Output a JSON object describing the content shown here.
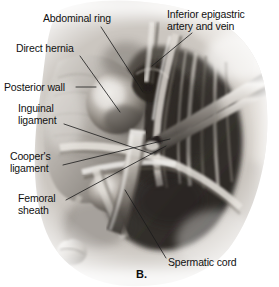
{
  "figure": {
    "letter": "B.",
    "caption_labels": [
      {
        "id": "abdominal-ring",
        "text": "Abdominal ring",
        "x": 43,
        "y": 12,
        "align": "left"
      },
      {
        "id": "inferior-epigastric-artery-and-vein",
        "text": "Inferior epigastric\nartery and vein",
        "x": 194,
        "y": 8,
        "align": "left"
      },
      {
        "id": "direct-hernia",
        "text": "Direct hernia",
        "x": 16,
        "y": 42,
        "align": "left"
      },
      {
        "id": "posterior-wall",
        "text": "Posterior wall",
        "x": 6,
        "y": 82,
        "align": "left"
      },
      {
        "id": "inguinal-ligament",
        "text": "Inguinal\nligament",
        "x": 18,
        "y": 103,
        "align": "left"
      },
      {
        "id": "coopers-ligament",
        "text": "Cooper's\nligament",
        "x": 10,
        "y": 150,
        "align": "left"
      },
      {
        "id": "femoral-sheath",
        "text": "Femoral\nsheath",
        "x": 18,
        "y": 192,
        "align": "left"
      },
      {
        "id": "spermatic-cord",
        "text": "Spermatic cord",
        "x": 168,
        "y": 256,
        "align": "left"
      }
    ],
    "leaders": [
      {
        "id": "leader-abdominal-ring",
        "x1": 101,
        "y1": 27,
        "x2": 143,
        "y2": 92
      },
      {
        "id": "leader-inferior-epigastric",
        "x1": 192,
        "y1": 33,
        "x2": 152,
        "y2": 66
      },
      {
        "id": "leader-direct-hernia",
        "x1": 80,
        "y1": 56,
        "x2": 120,
        "y2": 112
      },
      {
        "id": "leader-posterior-wall",
        "x1": 76,
        "y1": 87,
        "x2": 96,
        "y2": 87
      },
      {
        "id": "leader-inguinal-ligament",
        "x1": 64,
        "y1": 124,
        "x2": 152,
        "y2": 154
      },
      {
        "id": "leader-coopers-ligament",
        "x1": 63,
        "y1": 165,
        "x2": 170,
        "y2": 139
      },
      {
        "id": "leader-femoral-sheath",
        "x1": 66,
        "y1": 200,
        "x2": 166,
        "y2": 146
      },
      {
        "id": "leader-spermatic-cord",
        "x1": 166,
        "y1": 258,
        "x2": 125,
        "y2": 190
      }
    ]
  },
  "colors": {
    "text": "#111111",
    "leader_line": "#1a1a1a",
    "background": "#ffffff",
    "tissue_light": "#e8e6e3",
    "tissue_mid": "#a8a39d",
    "tissue_dark": "#4a4640",
    "tissue_deep": "#2a2724",
    "instrument": "#d8d5d0"
  },
  "illustration": {
    "description": "Grayscale surgical illustration of the right inguinal region seen from within, showing a direct hernia bulge, the posterior inguinal wall, inguinal and Cooper's ligaments, femoral sheath, spermatic cord, and inferior epigastric vessels, retracted by instruments.",
    "structures": [
      "abdominal-ring",
      "direct-hernia-bulge",
      "posterior-wall",
      "inguinal-ligament",
      "coopers-ligament",
      "femoral-sheath",
      "spermatic-cord",
      "inferior-epigastric-vessels",
      "retractor-instrument"
    ]
  }
}
